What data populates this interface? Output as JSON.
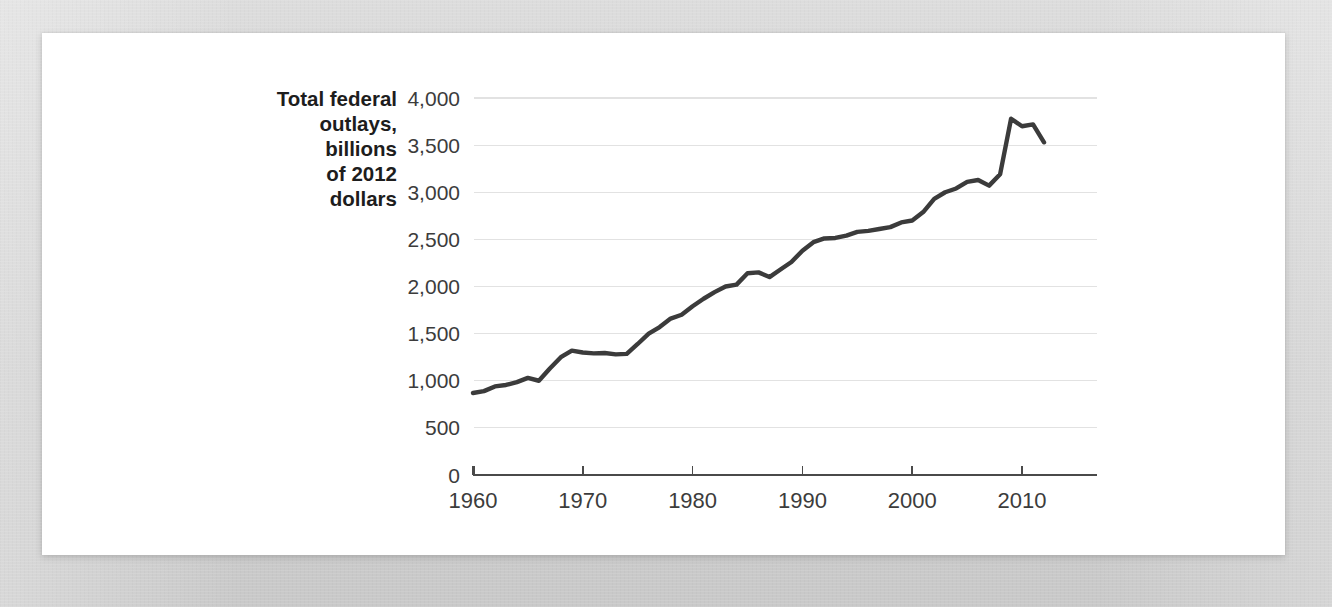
{
  "figure": {
    "background_color": "#d5d5d5",
    "card_color": "#ffffff"
  },
  "chart_data": {
    "type": "line",
    "title": "",
    "xlabel": "",
    "ylabel": "Total federal outlays, billions of 2012 dollars",
    "ylabel_lines": [
      "Total federal",
      "outlays,",
      "billions",
      "of 2012",
      "dollars"
    ],
    "line_color": "#3b3b3b",
    "grid": true,
    "grid_color": "#e2e2e2",
    "legend": "none",
    "xlim": [
      1959,
      2013
    ],
    "ylim": [
      0,
      4000
    ],
    "yticks": [
      0,
      500,
      1000,
      1500,
      2000,
      2500,
      3000,
      3500,
      4000
    ],
    "ytick_labels": [
      "0",
      "500",
      "1,000",
      "1,500",
      "2,000",
      "2,500",
      "3,000",
      "3,500",
      "4,000"
    ],
    "xticks": [
      1960,
      1970,
      1980,
      1990,
      2000,
      2010
    ],
    "xtick_labels": [
      "1960",
      "1970",
      "1980",
      "1990",
      "2000",
      "2010"
    ],
    "series": [
      {
        "name": "Total federal outlays",
        "x": [
          1960,
          1961,
          1962,
          1963,
          1964,
          1965,
          1966,
          1967,
          1968,
          1969,
          1970,
          1971,
          1972,
          1973,
          1974,
          1975,
          1976,
          1977,
          1978,
          1979,
          1980,
          1981,
          1982,
          1983,
          1984,
          1985,
          1986,
          1987,
          1988,
          1989,
          1990,
          1991,
          1992,
          1993,
          1994,
          1995,
          1996,
          1997,
          1998,
          1999,
          2000,
          2001,
          2002,
          2003,
          2004,
          2005,
          2006,
          2007,
          2008,
          2009,
          2010,
          2011,
          2012
        ],
        "values": [
          870,
          890,
          940,
          955,
          985,
          1030,
          1000,
          1130,
          1250,
          1320,
          1300,
          1290,
          1295,
          1280,
          1285,
          1390,
          1500,
          1570,
          1660,
          1700,
          1790,
          1870,
          1940,
          2000,
          2020,
          2140,
          2150,
          2100,
          2180,
          2260,
          2380,
          2470,
          2510,
          2515,
          2540,
          2580,
          2590,
          2610,
          2630,
          2680,
          2700,
          2790,
          2930,
          3000,
          3040,
          3110,
          3130,
          3070,
          3190,
          3780,
          3700,
          3720,
          3530
        ]
      }
    ],
    "annotations": [
      {
        "label": "peak",
        "x": 2009,
        "y": 3780
      },
      {
        "label": "series-start",
        "x": 1960,
        "y": 870
      },
      {
        "label": "series-end",
        "x": 2012,
        "y": 3530
      }
    ]
  }
}
